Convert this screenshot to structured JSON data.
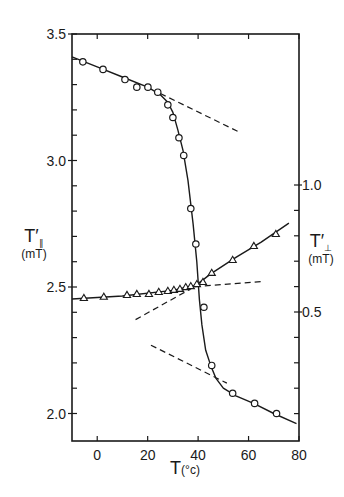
{
  "chart_data": {
    "type": "scatter",
    "title": "",
    "xlabel": "T (°c)",
    "ylabel_left": "T′∥ (mT)",
    "ylabel_right": "T′⊥ (mT)",
    "xlim": [
      -10,
      80
    ],
    "ylim_left": [
      1.9,
      3.5
    ],
    "ylim_right": [
      0.1,
      1.3
    ],
    "x_ticks": [
      0,
      20,
      40,
      60,
      80
    ],
    "y_ticks_left": [
      "2.0",
      "2.5",
      "3.0",
      "3.5"
    ],
    "y_ticks_right": [
      "0.5",
      "1.0"
    ],
    "grid": false,
    "legend": "none",
    "series": [
      {
        "name": "T′∥",
        "axis": "left",
        "marker": "circle",
        "x": [
          -5.7,
          2.3,
          11.0,
          15.7,
          20.1,
          24.0,
          28.0,
          30.0,
          32.4,
          34.3,
          37.1,
          39.1,
          42.3,
          45.4,
          53.7,
          62.4,
          71.1
        ],
        "y": [
          3.39,
          3.36,
          3.32,
          3.29,
          3.29,
          3.27,
          3.22,
          3.17,
          3.09,
          3.02,
          2.81,
          2.67,
          2.42,
          2.19,
          2.08,
          2.04,
          2.0
        ]
      },
      {
        "name": "T′⊥",
        "axis": "right",
        "marker": "triangle",
        "x": [
          -5.3,
          2.6,
          11.8,
          15.7,
          20.5,
          24.4,
          28.0,
          30.4,
          32.8,
          35.1,
          37.1,
          39.5,
          41.9,
          45.4,
          53.7,
          62.1,
          70.8
        ],
        "y": [
          0.555,
          0.56,
          0.567,
          0.571,
          0.571,
          0.579,
          0.583,
          0.587,
          0.591,
          0.598,
          0.602,
          0.61,
          0.618,
          0.654,
          0.705,
          0.76,
          0.807
        ]
      }
    ],
    "fit_curves": [
      {
        "axis": "left",
        "style": "solid",
        "x": [
          -10,
          0,
          10,
          20,
          25,
          28,
          30,
          32,
          34,
          36,
          38,
          39.5,
          40.5,
          41.5,
          43,
          45,
          47,
          50,
          55,
          62,
          70,
          79
        ],
        "y": [
          3.41,
          3.37,
          3.33,
          3.29,
          3.26,
          3.23,
          3.19,
          3.12,
          3.04,
          2.92,
          2.75,
          2.6,
          2.45,
          2.35,
          2.25,
          2.19,
          2.14,
          2.1,
          2.07,
          2.04,
          2.0,
          1.96
        ]
      },
      {
        "axis": "right",
        "style": "solid",
        "x": [
          -10,
          10,
          30,
          38,
          40,
          45,
          55,
          65,
          76
        ],
        "y": [
          0.551,
          0.563,
          0.585,
          0.603,
          0.612,
          0.65,
          0.715,
          0.775,
          0.85
        ]
      }
    ],
    "annotations": [
      {
        "type": "dashed",
        "axis": "left",
        "x": [
          25,
          56.8
        ],
        "y": [
          3.265,
          3.11
        ]
      },
      {
        "type": "dashed",
        "axis": "right",
        "x": [
          15.2,
          38.7
        ],
        "y": [
          0.47,
          0.6
        ]
      },
      {
        "type": "dashed",
        "axis": "right",
        "x": [
          38.7,
          65.3
        ],
        "y": [
          0.6,
          0.62
        ]
      },
      {
        "type": "dashed",
        "axis": "left",
        "x": [
          21.3,
          51.4
        ],
        "y": [
          2.27,
          2.12
        ]
      }
    ]
  },
  "labels": {
    "x_axis_title": "T",
    "x_axis_unit": "(°c)",
    "left_title": "T′",
    "left_sub": "∥",
    "left_unit": "(mT)",
    "right_title": "T′",
    "right_sub": "⊥",
    "right_unit": "(mT)"
  }
}
